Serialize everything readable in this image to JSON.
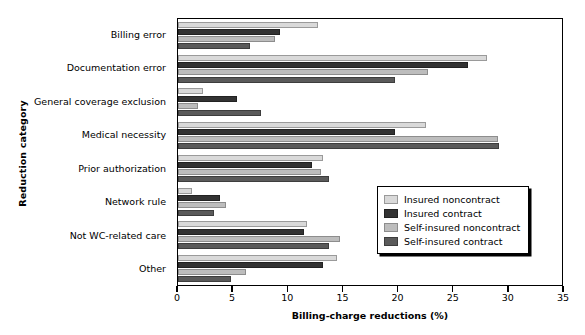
{
  "chart_data": {
    "type": "bar",
    "orientation": "horizontal",
    "title": "",
    "xlabel": "Billing-charge reductions (%)",
    "ylabel": "Reduction category",
    "xlim": [
      0,
      35
    ],
    "xticks": [
      0,
      5,
      10,
      15,
      20,
      25,
      30,
      35
    ],
    "grid": false,
    "legend_position": "center-right",
    "categories": [
      "Billing error",
      "Documentation error",
      "General coverage exclusion",
      "Medical necessity",
      "Prior authorization",
      "Network rule",
      "Not WC-related care",
      "Other"
    ],
    "series": [
      {
        "name": "Insured noncontract",
        "color": "#d9d9d9",
        "values": [
          12.8,
          28.2,
          2.3,
          22.6,
          13.2,
          1.3,
          11.8,
          14.5
        ]
      },
      {
        "name": "Insured contract",
        "color": "#333333",
        "values": [
          9.3,
          26.4,
          5.4,
          19.8,
          12.2,
          3.8,
          11.5,
          13.2
        ]
      },
      {
        "name": "Self-insured noncontract",
        "color": "#bdbdbd",
        "values": [
          8.8,
          22.8,
          1.8,
          29.2,
          13.0,
          4.4,
          14.8,
          6.2
        ]
      },
      {
        "name": "Self-insured contract",
        "color": "#5a5a5a",
        "values": [
          6.6,
          19.8,
          7.6,
          29.3,
          13.8,
          3.3,
          13.8,
          4.8
        ]
      }
    ]
  }
}
